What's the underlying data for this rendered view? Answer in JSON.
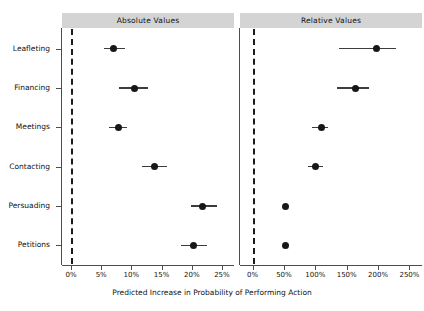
{
  "figure": {
    "x_axis_title": "Predicted Increase in Probability of Performing Action",
    "panels": [
      {
        "label": "Absolute Values"
      },
      {
        "label": "Relative Values"
      }
    ],
    "categories": [
      "Leafleting",
      "Financing",
      "Meetings",
      "Contacting",
      "Persuading",
      "Petitions"
    ],
    "colors": {
      "strip_fill": "#d4d4d4",
      "point": "#171717",
      "errorbar": "#3c3c3c",
      "axis": "#4d4d4d",
      "reference_line": "#1a1a1a",
      "background": "#ffffff"
    }
  },
  "chart_data": {
    "type": "scatter",
    "title": "",
    "subtitle": "",
    "xlabel": "Predicted Increase in Probability of Performing Action",
    "ylabel": "",
    "grid": false,
    "legend": "none",
    "orientation": "horizontal",
    "panel_layout": "1x2",
    "categories": [
      "Leafleting",
      "Financing",
      "Meetings",
      "Contacting",
      "Persuading",
      "Petitions"
    ],
    "reference_line_x": 0,
    "panels": [
      {
        "name": "Absolute Values",
        "xlabel": "",
        "xlim": [
          -1.5,
          27
        ],
        "xticks": [
          0,
          5,
          10,
          15,
          20,
          25
        ],
        "xticklabels": [
          "0%",
          "5%",
          "10%",
          "15%",
          "20%",
          "25%"
        ],
        "units": "percentage points",
        "points": [
          {
            "category": "Leafleting",
            "estimate": 7.0,
            "ci_low": 5.4,
            "ci_high": 8.9
          },
          {
            "category": "Financing",
            "estimate": 10.5,
            "ci_low": 8.0,
            "ci_high": 12.8
          },
          {
            "category": "Meetings",
            "estimate": 7.8,
            "ci_low": 6.3,
            "ci_high": 9.3
          },
          {
            "category": "Contacting",
            "estimate": 13.8,
            "ci_low": 11.7,
            "ci_high": 15.9
          },
          {
            "category": "Persuading",
            "estimate": 21.8,
            "ci_low": 19.8,
            "ci_high": 24.2
          },
          {
            "category": "Petitions",
            "estimate": 20.3,
            "ci_low": 18.3,
            "ci_high": 22.5
          }
        ]
      },
      {
        "name": "Relative Values",
        "xlabel": "",
        "xlim": [
          -20,
          270
        ],
        "xticks": [
          0,
          50,
          100,
          150,
          200,
          250
        ],
        "xticklabels": [
          "0%",
          "50%",
          "100%",
          "150%",
          "200%",
          "250%"
        ],
        "units": "percent change",
        "points": [
          {
            "category": "Leafleting",
            "estimate": 197,
            "ci_low": 137,
            "ci_high": 228
          },
          {
            "category": "Financing",
            "estimate": 164,
            "ci_low": 134,
            "ci_high": 186
          },
          {
            "category": "Meetings",
            "estimate": 110,
            "ci_low": 94,
            "ci_high": 121
          },
          {
            "category": "Contacting",
            "estimate": 101,
            "ci_low": 89,
            "ci_high": 112
          },
          {
            "category": "Persuading",
            "estimate": 52,
            "ci_low": 52,
            "ci_high": 52
          },
          {
            "category": "Petitions",
            "estimate": 52,
            "ci_low": 52,
            "ci_high": 52
          }
        ]
      }
    ]
  }
}
